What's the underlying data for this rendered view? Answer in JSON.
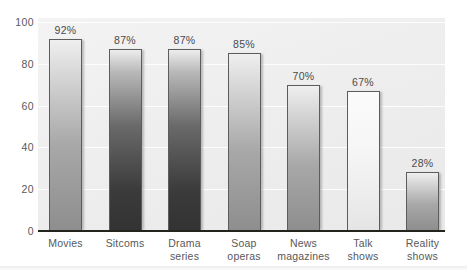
{
  "chart_data": {
    "type": "bar",
    "title": "",
    "subtitle": "",
    "xlabel": "",
    "ylabel": "",
    "ylim": [
      0,
      100
    ],
    "ytick_values": [
      0,
      20,
      40,
      60,
      80,
      100
    ],
    "ytick_labels": [
      "0",
      "20",
      "40",
      "60",
      "80",
      "100"
    ],
    "grid": true,
    "grid_axis": "y",
    "legend": false,
    "legend_position": "none",
    "value_label_suffix": "%",
    "categories": [
      "Movies",
      "Sitcoms",
      "Drama series",
      "Soap operas",
      "News magazines",
      "Talk shows",
      "Reality shows"
    ],
    "values": [
      92,
      87,
      87,
      85,
      70,
      67,
      28
    ],
    "data_labels": [
      "92%",
      "87%",
      "87%",
      "85%",
      "70%",
      "67%",
      "28%"
    ],
    "bars": [
      {
        "category_lines": [
          "Movies"
        ],
        "value": 92,
        "label": "92%",
        "shade": "medium"
      },
      {
        "category_lines": [
          "Sitcoms"
        ],
        "value": 87,
        "label": "87%",
        "shade": "dark"
      },
      {
        "category_lines": [
          "Drama",
          "series"
        ],
        "value": 87,
        "label": "87%",
        "shade": "dark"
      },
      {
        "category_lines": [
          "Soap",
          "operas"
        ],
        "value": 85,
        "label": "85%",
        "shade": "medium"
      },
      {
        "category_lines": [
          "News",
          "magazines"
        ],
        "value": 70,
        "label": "70%",
        "shade": "medium"
      },
      {
        "category_lines": [
          "Talk",
          "shows"
        ],
        "value": 67,
        "label": "67%",
        "shade": "verylight"
      },
      {
        "category_lines": [
          "Reality",
          "shows"
        ],
        "value": 28,
        "label": "28%",
        "shade": "medium"
      }
    ],
    "colors": {
      "plot_background": "#eeeeee",
      "gridline": "#fdfdfd",
      "axis_line": "#24241f",
      "bar_outline": "#5c5c5c",
      "text": "#58585a"
    }
  }
}
